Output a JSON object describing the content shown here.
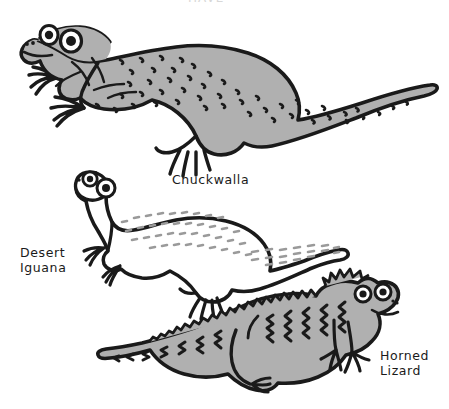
{
  "page": {
    "kind": "hand-drawn natural history illustration",
    "background_color": "#ffffff",
    "ink_color": "#1a1a1a",
    "width": 449,
    "height": 409
  },
  "title": {
    "text": "HAVE",
    "clipped": true,
    "color": "#d8d8d8"
  },
  "labels": {
    "chuckwalla": "Chuckwalla",
    "desert_iguana": "Desert\nIguana",
    "horned_lizard": "Horned\nLizard"
  },
  "figures": [
    {
      "name": "chuckwalla",
      "label": "Chuckwalla",
      "facing": "left",
      "fill_color": "#b0b0b0",
      "outline_color": "#1a1a1a",
      "pattern": "comma-shaped dark speckles over back, flank and tail",
      "features": [
        "two round eyes",
        "nostril dots",
        "clawed front feet",
        "clawed hind foot",
        "long tapering tail"
      ]
    },
    {
      "name": "desert-iguana",
      "label": "Desert Iguana",
      "facing": "left",
      "fill_color": "#ffffff",
      "outline_color": "#1a1a1a",
      "pattern": "gray dashed spots on back, banded dashes on tail",
      "features": [
        "two large round eyes",
        "nostril dots",
        "clawed front feet",
        "clawed hind foot",
        "long banded tail"
      ]
    },
    {
      "name": "horned-lizard",
      "label": "Horned Lizard",
      "facing": "right",
      "fill_color": "#b0b0b0",
      "outline_color": "#1a1a1a",
      "pattern": "zigzag bars along back, chevrons along tail, spiny fringe",
      "features": [
        "two round eyes",
        "horned crown",
        "smiling mouth",
        "spiny serrated back and tail",
        "clawed feet"
      ]
    }
  ],
  "palette": {
    "body_gray": "#b0b0b0",
    "dash_gray": "#9a9a9a",
    "ink": "#1a1a1a",
    "white": "#ffffff"
  }
}
